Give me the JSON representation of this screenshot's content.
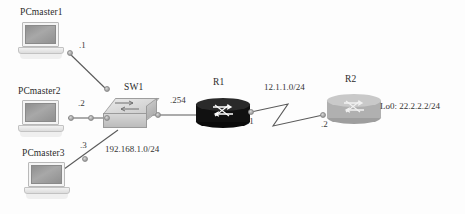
{
  "diagram": {
    "background_color": "#fdfdfd",
    "link_color": "#5a5a5a"
  },
  "nodes": [
    {
      "id": "pcmaster1",
      "label": "PCmaster1",
      "type": "laptop",
      "icon": "laptop-icon",
      "x": 18,
      "y": 22,
      "label_x": 20,
      "label_y": 7
    },
    {
      "id": "pcmaster2",
      "label": "PCmaster2",
      "type": "laptop",
      "icon": "laptop-icon",
      "x": 18,
      "y": 100,
      "label_x": 18,
      "label_y": 86
    },
    {
      "id": "pcmaster3",
      "label": "PCmaster3",
      "type": "laptop",
      "icon": "laptop-icon",
      "x": 24,
      "y": 162,
      "label_x": 22,
      "label_y": 148
    },
    {
      "id": "sw1",
      "label": "SW1",
      "type": "switch",
      "icon": "switch-icon",
      "x": 103,
      "y": 98,
      "label_x": 124,
      "label_y": 82
    },
    {
      "id": "r1",
      "label": "R1",
      "type": "router",
      "icon": "router-icon",
      "variant": "dark",
      "x": 196,
      "y": 92,
      "label_x": 213,
      "label_y": 77
    },
    {
      "id": "r2",
      "label": "R2",
      "type": "router",
      "icon": "router-icon",
      "variant": "light",
      "x": 327,
      "y": 88,
      "label_x": 345,
      "label_y": 74
    }
  ],
  "interface_labels": [
    {
      "id": "pc1-ip",
      "text": ".1",
      "x": 79,
      "y": 40
    },
    {
      "id": "pc2-ip",
      "text": ".2",
      "x": 78,
      "y": 98
    },
    {
      "id": "pc3-ip",
      "text": ".3",
      "x": 80,
      "y": 140
    },
    {
      "id": "r1-lan-ip",
      "text": ".254",
      "x": 170,
      "y": 95
    },
    {
      "id": "r1-wan-ip",
      "text": ".1",
      "x": 247,
      "y": 118
    },
    {
      "id": "r2-wan-ip",
      "text": ".2",
      "x": 321,
      "y": 121
    }
  ],
  "network_labels": [
    {
      "id": "lan-subnet",
      "text": "192.168.1.0/24",
      "x": 105,
      "y": 144
    },
    {
      "id": "wan-subnet",
      "text": "12.1.1.0/24",
      "x": 264,
      "y": 82
    }
  ],
  "loopback_labels": [
    {
      "id": "r2-loopback",
      "text": "Lo0:  22.2.2.2/24",
      "x": 380,
      "y": 101
    }
  ],
  "connection_dots": [
    {
      "id": "dot-pc1-out",
      "x": 67,
      "y": 50
    },
    {
      "id": "dot-pc1-sw",
      "x": 104,
      "y": 86
    },
    {
      "id": "dot-pc2-out",
      "x": 68,
      "y": 115
    },
    {
      "id": "dot-pc2-mid",
      "x": 88,
      "y": 115
    },
    {
      "id": "dot-pc2-sw",
      "x": 104,
      "y": 115
    },
    {
      "id": "dot-pc3-sw",
      "x": 82,
      "y": 156
    },
    {
      "id": "dot-sw-r1",
      "x": 155,
      "y": 112
    },
    {
      "id": "dot-r1-wan",
      "x": 248,
      "y": 110
    },
    {
      "id": "dot-r2-wan",
      "x": 320,
      "y": 113
    }
  ]
}
